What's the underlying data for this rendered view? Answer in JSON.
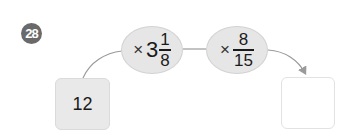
{
  "problem": {
    "number": "28"
  },
  "start": {
    "value": "12"
  },
  "steps": [
    {
      "operator": "×",
      "whole": "3",
      "numerator": "1",
      "denominator": "8"
    },
    {
      "operator": "×",
      "whole": "",
      "numerator": "8",
      "denominator": "15"
    }
  ],
  "answer": {
    "value": ""
  },
  "colors": {
    "ellipse_fill": "#e6e6e6",
    "start_box_fill": "#e9e9e9",
    "badge_fill": "#6a6a6a",
    "line": "#9a9a9a"
  }
}
